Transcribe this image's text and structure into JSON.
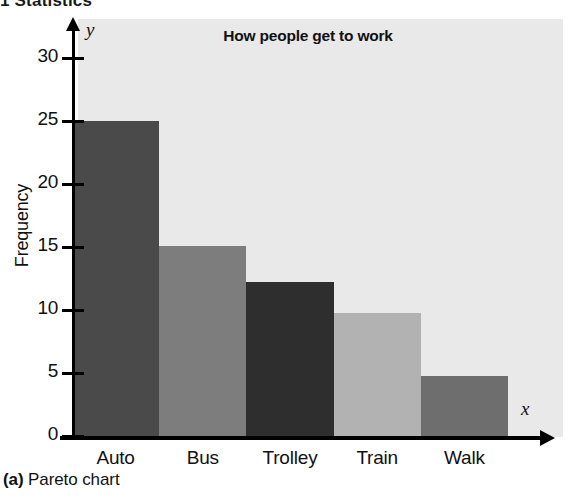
{
  "running_header": "1 Statistics",
  "caption": {
    "label": "(a)",
    "text": "Pareto chart"
  },
  "chart_data": {
    "type": "bar",
    "title": "How people get to work",
    "xlabel": "",
    "ylabel": "Frequency",
    "x_axis_variable": "x",
    "y_axis_variable": "y",
    "categories": [
      "Auto",
      "Bus",
      "Trolley",
      "Train",
      "Walk"
    ],
    "values": [
      25,
      15.1,
      12.2,
      9.8,
      4.8
    ],
    "yticks": [
      0,
      5,
      10,
      15,
      20,
      25,
      30
    ],
    "ylim": [
      0,
      32
    ],
    "grid": false,
    "legend": null,
    "bar_colors": [
      "#4a4a4a",
      "#7d7d7d",
      "#2e2e2e",
      "#b2b2b2",
      "#6e6e6e"
    ],
    "plot_background": "#e9e9e9",
    "axis_color": "#000000"
  }
}
